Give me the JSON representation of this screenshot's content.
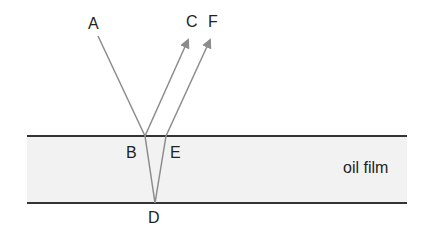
{
  "diagram": {
    "labels": {
      "A": "A",
      "B": "B",
      "C": "C",
      "D": "D",
      "E": "E",
      "F": "F",
      "film": "oil film"
    },
    "colors": {
      "film_fill": "#f2f2f2",
      "boundary": "#333333",
      "ray": "#8c8c8c",
      "text": "#222222"
    },
    "rays": [
      {
        "name": "incident AB",
        "from": "A",
        "to": "B"
      },
      {
        "name": "reflected BC",
        "from": "B",
        "to": "C",
        "arrow": true
      },
      {
        "name": "refracted BD",
        "from": "B",
        "to": "D"
      },
      {
        "name": "reflected DE",
        "from": "D",
        "to": "E"
      },
      {
        "name": "refracted EF",
        "from": "E",
        "to": "F",
        "arrow": true
      }
    ]
  }
}
